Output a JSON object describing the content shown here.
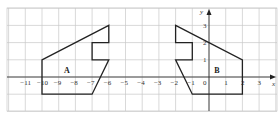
{
  "diagram": {
    "type": "coordinate-grid",
    "axes": {
      "x_label": "x",
      "y_label": "y"
    },
    "x_ticks": [
      "-11",
      "-10",
      "-9",
      "-8",
      "-7",
      "-6",
      "-5",
      "-4",
      "-3",
      "-2",
      "-1",
      "0",
      "1",
      "2",
      "3"
    ],
    "y_ticks": [
      "1",
      "2",
      "3"
    ],
    "origin_label": "0",
    "grid": {
      "x_min": -12,
      "x_max": 4,
      "y_min": -2,
      "y_max": 4
    },
    "shapes": [
      {
        "label": "A",
        "label_pos": [
          -8.5,
          0.4
        ],
        "points": [
          [
            -10,
            1
          ],
          [
            -6,
            3
          ],
          [
            -6,
            2
          ],
          [
            -7,
            2
          ],
          [
            -7,
            1
          ],
          [
            -6,
            1
          ],
          [
            -7,
            -1
          ],
          [
            -10,
            -1
          ]
        ]
      },
      {
        "label": "B",
        "label_pos": [
          0.5,
          0.4
        ],
        "points": [
          [
            -2,
            3
          ],
          [
            2,
            1
          ],
          [
            2,
            -1
          ],
          [
            -1,
            -1
          ],
          [
            -2,
            1
          ],
          [
            -1,
            1
          ],
          [
            -1,
            2
          ],
          [
            -2,
            2
          ]
        ]
      }
    ],
    "colors": {
      "grid": "#c8c8c8",
      "axis": "#222222",
      "shape": "#222222"
    }
  }
}
